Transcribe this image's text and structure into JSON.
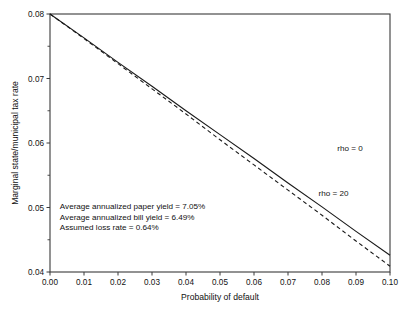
{
  "chart_data": {
    "type": "line",
    "title": "",
    "xlabel": "Probability of default",
    "ylabel": "Marginal state/municipal tax rate",
    "xlim": [
      0.0,
      0.1
    ],
    "ylim": [
      0.04,
      0.08
    ],
    "xticks": [
      "0.00",
      "0.01",
      "0.02",
      "0.03",
      "0.04",
      "0.05",
      "0.06",
      "0.07",
      "0.08",
      "0.09",
      "0.10"
    ],
    "xtick_values": [
      0.0,
      0.01,
      0.02,
      0.03,
      0.04,
      0.05,
      0.06,
      0.07,
      0.08,
      0.09,
      0.1
    ],
    "yticks": [
      "0.08",
      "0.07",
      "0.06",
      "0.05",
      "0.04"
    ],
    "ytick_values": [
      0.08,
      0.07,
      0.06,
      0.05,
      0.04
    ],
    "y_minor_ticks": [
      0.075,
      0.065,
      0.055,
      0.045
    ],
    "grid": false,
    "legend_position": "inline-right",
    "series": [
      {
        "name": "rho = 0",
        "style": "solid",
        "label_x": 0.0845,
        "label_y": 0.0587,
        "x": [
          0.0,
          0.01,
          0.02,
          0.03,
          0.04,
          0.05,
          0.06,
          0.07,
          0.08,
          0.09,
          0.1
        ],
        "values": [
          0.08,
          0.0763,
          0.0725,
          0.0688,
          0.065,
          0.0613,
          0.0576,
          0.0538,
          0.0501,
          0.0463,
          0.0426
        ]
      },
      {
        "name": "rho = 20",
        "style": "dashed",
        "label_x": 0.079,
        "label_y": 0.0518,
        "x": [
          0.0,
          0.01,
          0.02,
          0.03,
          0.04,
          0.05,
          0.06,
          0.07,
          0.08,
          0.09,
          0.1
        ],
        "values": [
          0.08,
          0.0762,
          0.0723,
          0.0684,
          0.0645,
          0.0605,
          0.0566,
          0.0527,
          0.0488,
          0.0448,
          0.0409
        ]
      }
    ],
    "annotations": [
      "Average annualized paper yield = 7.05%",
      "Average annualized bill yield = 6.49%",
      "Assumed loss rate = 0.64%"
    ],
    "annotation_origin": {
      "x": 0.0029,
      "y": 0.0497
    },
    "colors": {
      "line": "#1a1a1a",
      "axis": "#3a3a3a",
      "text": "#111111",
      "background": "#ffffff"
    }
  }
}
